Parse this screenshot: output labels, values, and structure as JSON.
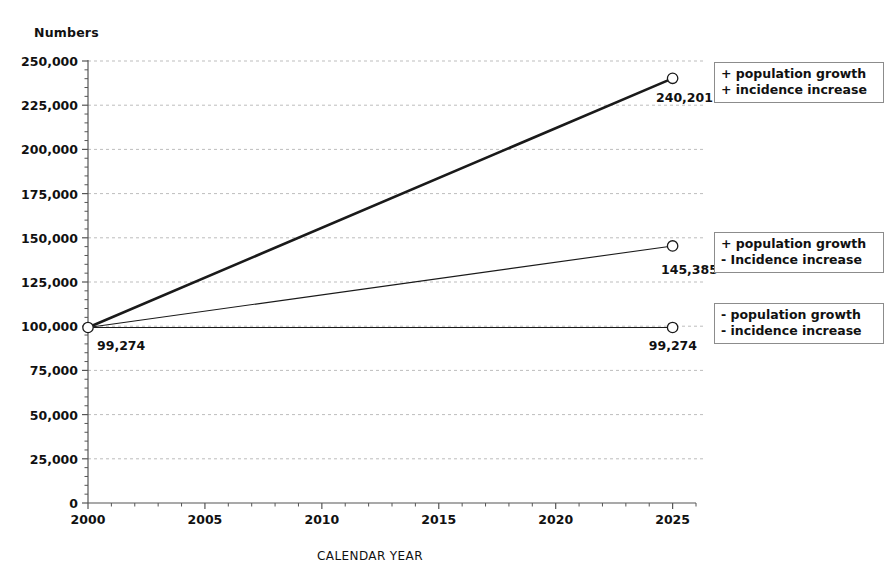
{
  "chart_data": {
    "type": "line",
    "title": "",
    "ylabel": "Numbers",
    "xlabel": "CALENDAR YEAR",
    "x": [
      2000,
      2025
    ],
    "xlim": [
      2000,
      2026
    ],
    "ylim": [
      0,
      250000
    ],
    "xticks": [
      "2000",
      "2005",
      "2010",
      "2015",
      "2020",
      "2025"
    ],
    "xtick_values": [
      2000,
      2005,
      2010,
      2015,
      2020,
      2025
    ],
    "yticks": [
      "0",
      "25,000",
      "50,000",
      "75,000",
      "100,000",
      "125,000",
      "150,000",
      "175,000",
      "200,000",
      "225,000",
      "250,000"
    ],
    "ytick_values": [
      0,
      25000,
      50000,
      75000,
      100000,
      125000,
      150000,
      175000,
      200000,
      225000,
      250000
    ],
    "grid": true,
    "legend_position": "right",
    "series": [
      {
        "name": "+ population growth / + incidence increase",
        "values": [
          99274,
          240201
        ],
        "end_label": "240,201",
        "start_label": "99,274",
        "style": "thick-solid"
      },
      {
        "name": "+ population growth / - Incidence increase",
        "values": [
          99274,
          145385
        ],
        "end_label": "145,385",
        "start_label": "99,274",
        "style": "thin-solid"
      },
      {
        "name": "- population growth / - incidence increase",
        "values": [
          99274,
          99274
        ],
        "end_label": "99,274",
        "start_label": "99,274",
        "style": "thin-solid"
      }
    ]
  },
  "legends": [
    {
      "line1": "+ population growth",
      "line2": "+ incidence increase"
    },
    {
      "line1": "+ population growth",
      "line2": "- Incidence increase"
    },
    {
      "line1": "- population growth",
      "line2": "- incidence increase"
    }
  ],
  "colors": {
    "axis": "#555555",
    "grid": "#bdbdbd",
    "series": "#1a1a1a",
    "legend_border": "#8c8c8c",
    "text": "#111111",
    "background": "#ffffff"
  }
}
